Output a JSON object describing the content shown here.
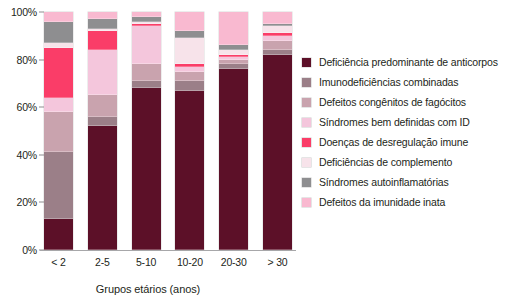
{
  "chart_data": {
    "type": "bar",
    "subtype": "100% stacked column",
    "title": "",
    "xlabel": "Grupos etários (anos)",
    "ylabel": "",
    "ylim": [
      0,
      100
    ],
    "yticks": [
      "0%",
      "20%",
      "40%",
      "60%",
      "80%",
      "100%"
    ],
    "ytick_values": [
      0,
      20,
      40,
      60,
      80,
      100
    ],
    "grid": false,
    "legend_position": "right",
    "categories": [
      "< 2",
      "2-5",
      "5-10",
      "10-20",
      "20-30",
      "> 30"
    ],
    "series": [
      {
        "name": "Deficiência predominante de anticorpos",
        "color": "#5c1028",
        "values": [
          13,
          52,
          68,
          67,
          76,
          82
        ]
      },
      {
        "name": "Imunodeficiências combinadas",
        "color": "#9b7f88",
        "values": [
          28,
          4,
          3,
          4,
          2,
          2
        ]
      },
      {
        "name": "Defeitos congênitos de fagócitos",
        "color": "#c9a3ae",
        "values": [
          17,
          9,
          7,
          4,
          2,
          4
        ]
      },
      {
        "name": "Síndromes bem definidas com ID",
        "color": "#f4c6dc",
        "values": [
          6,
          19,
          16,
          2,
          1,
          2
        ]
      },
      {
        "name": "Doenças de desregulação imune",
        "color": "#fa3d68",
        "values": [
          21,
          8,
          1,
          1,
          1,
          1
        ]
      },
      {
        "name": "Deficiências de complemento",
        "color": "#f7e3ea",
        "values": [
          2,
          1,
          1,
          11,
          2,
          3
        ]
      },
      {
        "name": "Síndromes autoinflamatórias",
        "color": "#8e8e90",
        "values": [
          9,
          4,
          2,
          3,
          2,
          1
        ]
      },
      {
        "name": "Defeitos da imunidade inata",
        "color": "#f9b9d0",
        "values": [
          4,
          3,
          2,
          8,
          14,
          5
        ]
      }
    ]
  },
  "axis": {
    "x_title": "Grupos etários (anos)"
  },
  "legend": {
    "items": [
      {
        "label": "Deficiência predominante de anticorpos",
        "color": "#5c1028"
      },
      {
        "label": "Imunodeficiências combinadas",
        "color": "#9b7f88"
      },
      {
        "label": "Defeitos congênitos de fagócitos",
        "color": "#c9a3ae"
      },
      {
        "label": "Síndromes bem definidas com ID",
        "color": "#f4c6dc"
      },
      {
        "label": "Doenças de desregulação imune",
        "color": "#fa3d68"
      },
      {
        "label": "Deficiências de complemento",
        "color": "#f7e3ea"
      },
      {
        "label": "Síndromes autoinflamatórias",
        "color": "#8e8e90"
      },
      {
        "label": "Defeitos da imunidade inata",
        "color": "#f9b9d0"
      }
    ]
  }
}
